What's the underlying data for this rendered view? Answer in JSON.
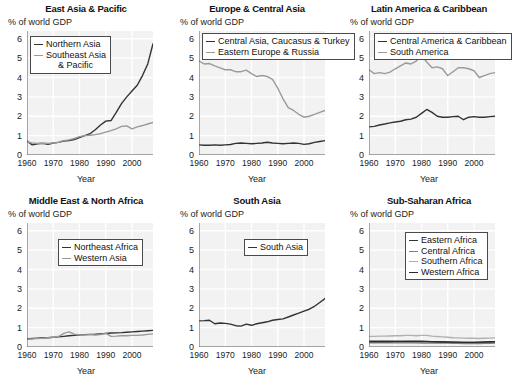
{
  "figure": {
    "ylabel_note": "% of world GDP",
    "xlabel": "Year",
    "yticks": [
      "0",
      "1",
      "2",
      "3",
      "4",
      "5",
      "6"
    ],
    "xticks": [
      "1960",
      "1970",
      "1980",
      "1990",
      "2000"
    ],
    "colors": {
      "dark": "#333333",
      "mid": "#8a8a8a",
      "light": "#b4b4b4",
      "plot_bg": "#f2f2f2",
      "gridline": "#ffffff",
      "legend_border": "#4a4a4a"
    }
  },
  "chart_data": [
    {
      "type": "line",
      "title": "East Asia & Pacific",
      "xlabel": "Year",
      "ylabel": "% of world GDP",
      "xlim": [
        1960,
        2008
      ],
      "ylim": [
        0,
        6.4
      ],
      "grid": true,
      "legend_position": "top-left",
      "x": [
        1960,
        1962,
        1964,
        1966,
        1968,
        1970,
        1972,
        1974,
        1976,
        1978,
        1980,
        1982,
        1984,
        1986,
        1988,
        1990,
        1992,
        1994,
        1996,
        1998,
        2000,
        2002,
        2004,
        2006,
        2008
      ],
      "series": [
        {
          "name": "Northern Asia",
          "color": "#333333",
          "values": [
            0.72,
            0.52,
            0.58,
            0.6,
            0.55,
            0.62,
            0.65,
            0.72,
            0.75,
            0.8,
            0.9,
            1.0,
            1.1,
            1.3,
            1.55,
            1.75,
            1.78,
            2.2,
            2.65,
            3.0,
            3.3,
            3.6,
            4.1,
            4.7,
            5.75
          ]
        },
        {
          "name": "Southeast Asia & Pacific",
          "color": "#9a9a9a",
          "values": [
            0.68,
            0.62,
            0.6,
            0.62,
            0.6,
            0.62,
            0.66,
            0.74,
            0.78,
            0.85,
            0.95,
            1.0,
            1.02,
            1.05,
            1.1,
            1.18,
            1.26,
            1.35,
            1.48,
            1.5,
            1.35,
            1.45,
            1.52,
            1.6,
            1.68
          ]
        }
      ]
    },
    {
      "type": "line",
      "title": "Europe & Central Asia",
      "xlabel": "Year",
      "ylabel": "% of world GDP",
      "xlim": [
        1960,
        2008
      ],
      "ylim": [
        0,
        6.4
      ],
      "grid": true,
      "legend_position": "top-left",
      "x": [
        1960,
        1962,
        1964,
        1966,
        1968,
        1970,
        1972,
        1974,
        1976,
        1978,
        1980,
        1982,
        1984,
        1986,
        1988,
        1990,
        1992,
        1994,
        1996,
        1998,
        2000,
        2002,
        2004,
        2006,
        2008
      ],
      "series": [
        {
          "name": "Central Asia, Caucasus & Turkey",
          "color": "#333333",
          "values": [
            0.52,
            0.5,
            0.5,
            0.52,
            0.5,
            0.52,
            0.54,
            0.6,
            0.62,
            0.6,
            0.58,
            0.6,
            0.62,
            0.66,
            0.62,
            0.6,
            0.58,
            0.6,
            0.62,
            0.6,
            0.55,
            0.58,
            0.65,
            0.7,
            0.74
          ]
        },
        {
          "name": "Eastern Europe & Russia",
          "color": "#9a9a9a",
          "values": [
            4.85,
            4.7,
            4.72,
            4.6,
            4.5,
            4.4,
            4.4,
            4.3,
            4.3,
            4.38,
            4.2,
            4.05,
            4.1,
            4.05,
            3.9,
            3.45,
            2.9,
            2.45,
            2.3,
            2.1,
            1.95,
            2.0,
            2.1,
            2.2,
            2.3
          ]
        }
      ]
    },
    {
      "type": "line",
      "title": "Latin America & Caribbean",
      "xlabel": "Year",
      "ylabel": "% of world GDP",
      "xlim": [
        1960,
        2008
      ],
      "ylim": [
        0,
        6.4
      ],
      "grid": true,
      "legend_position": "top-left",
      "x": [
        1960,
        1962,
        1964,
        1966,
        1968,
        1970,
        1972,
        1974,
        1976,
        1978,
        1980,
        1982,
        1984,
        1986,
        1988,
        1990,
        1992,
        1994,
        1996,
        1998,
        2000,
        2002,
        2004,
        2006,
        2008
      ],
      "series": [
        {
          "name": "Central America & Caribbean",
          "color": "#333333",
          "values": [
            1.45,
            1.48,
            1.55,
            1.6,
            1.66,
            1.7,
            1.74,
            1.82,
            1.85,
            1.95,
            2.15,
            2.35,
            2.2,
            2.0,
            1.95,
            1.95,
            1.98,
            2.0,
            1.82,
            1.95,
            1.98,
            1.95,
            1.95,
            1.98,
            2.0
          ]
        },
        {
          "name": "South America",
          "color": "#9a9a9a",
          "values": [
            4.4,
            4.2,
            4.25,
            4.2,
            4.28,
            4.45,
            4.6,
            4.75,
            4.7,
            4.85,
            5.15,
            4.8,
            4.5,
            4.55,
            4.45,
            4.1,
            4.3,
            4.5,
            4.5,
            4.45,
            4.35,
            4.0,
            4.1,
            4.2,
            4.25
          ]
        }
      ]
    },
    {
      "type": "line",
      "title": "Middle East & North Africa",
      "xlabel": "Year",
      "ylabel": "% of world GDP",
      "xlim": [
        1960,
        2008
      ],
      "ylim": [
        0,
        6.4
      ],
      "grid": true,
      "legend_position": "top-center",
      "x": [
        1960,
        1962,
        1964,
        1966,
        1968,
        1970,
        1972,
        1974,
        1976,
        1978,
        1980,
        1982,
        1984,
        1986,
        1988,
        1990,
        1992,
        1994,
        1996,
        1998,
        2000,
        2002,
        2004,
        2006,
        2008
      ],
      "series": [
        {
          "name": "Northeast Africa",
          "color": "#333333",
          "values": [
            0.42,
            0.44,
            0.46,
            0.48,
            0.48,
            0.5,
            0.52,
            0.55,
            0.58,
            0.6,
            0.62,
            0.64,
            0.65,
            0.66,
            0.68,
            0.7,
            0.72,
            0.73,
            0.74,
            0.76,
            0.78,
            0.8,
            0.82,
            0.84,
            0.86
          ]
        },
        {
          "name": "Western Asia",
          "color": "#9a9a9a",
          "values": [
            0.4,
            0.42,
            0.44,
            0.46,
            0.48,
            0.5,
            0.54,
            0.7,
            0.78,
            0.66,
            0.62,
            0.62,
            0.64,
            0.62,
            0.64,
            0.72,
            0.55,
            0.56,
            0.58,
            0.58,
            0.6,
            0.6,
            0.62,
            0.65,
            0.68
          ]
        }
      ]
    },
    {
      "type": "line",
      "title": "South Asia",
      "xlabel": "Year",
      "ylabel": "% of world GDP",
      "xlim": [
        1960,
        2008
      ],
      "ylim": [
        0,
        6.4
      ],
      "grid": true,
      "legend_position": "top-center",
      "x": [
        1960,
        1962,
        1964,
        1966,
        1968,
        1970,
        1972,
        1974,
        1976,
        1978,
        1980,
        1982,
        1984,
        1986,
        1988,
        1990,
        1992,
        1994,
        1996,
        1998,
        2000,
        2002,
        2004,
        2006,
        2008
      ],
      "series": [
        {
          "name": "South Asia",
          "color": "#333333",
          "values": [
            1.35,
            1.36,
            1.38,
            1.2,
            1.24,
            1.22,
            1.18,
            1.1,
            1.08,
            1.18,
            1.12,
            1.2,
            1.25,
            1.3,
            1.38,
            1.42,
            1.45,
            1.55,
            1.65,
            1.75,
            1.85,
            1.95,
            2.1,
            2.3,
            2.5
          ]
        }
      ]
    },
    {
      "type": "line",
      "title": "Sub-Saharan Africa",
      "xlabel": "Year",
      "ylabel": "% of world GDP",
      "xlim": [
        1960,
        2008
      ],
      "ylim": [
        0,
        6.4
      ],
      "grid": true,
      "legend_position": "top-center",
      "x": [
        1960,
        1962,
        1964,
        1966,
        1968,
        1970,
        1972,
        1974,
        1976,
        1978,
        1980,
        1982,
        1984,
        1986,
        1988,
        1990,
        1992,
        1994,
        1996,
        1998,
        2000,
        2002,
        2004,
        2006,
        2008
      ],
      "series": [
        {
          "name": "Eastern Africa",
          "color": "#333333",
          "values": [
            0.3,
            0.3,
            0.3,
            0.3,
            0.3,
            0.29,
            0.29,
            0.28,
            0.28,
            0.28,
            0.27,
            0.27,
            0.26,
            0.26,
            0.26,
            0.25,
            0.25,
            0.24,
            0.24,
            0.24,
            0.24,
            0.24,
            0.25,
            0.25,
            0.26
          ]
        },
        {
          "name": "Central Africa",
          "color": "#7d7d7d",
          "values": [
            0.22,
            0.22,
            0.22,
            0.22,
            0.22,
            0.22,
            0.22,
            0.22,
            0.22,
            0.22,
            0.21,
            0.21,
            0.21,
            0.2,
            0.2,
            0.2,
            0.19,
            0.19,
            0.18,
            0.18,
            0.18,
            0.18,
            0.19,
            0.19,
            0.2
          ]
        },
        {
          "name": "Southern Africa",
          "color": "#b0b0b0",
          "values": [
            0.55,
            0.55,
            0.56,
            0.56,
            0.57,
            0.58,
            0.58,
            0.6,
            0.6,
            0.58,
            0.6,
            0.6,
            0.56,
            0.54,
            0.52,
            0.5,
            0.48,
            0.47,
            0.46,
            0.45,
            0.45,
            0.44,
            0.45,
            0.46,
            0.47
          ]
        },
        {
          "name": "Western Africa",
          "color": "#2b2b2b",
          "values": [
            0.28,
            0.28,
            0.28,
            0.28,
            0.28,
            0.29,
            0.29,
            0.3,
            0.3,
            0.3,
            0.3,
            0.29,
            0.28,
            0.27,
            0.26,
            0.26,
            0.25,
            0.25,
            0.24,
            0.24,
            0.24,
            0.25,
            0.26,
            0.27,
            0.28
          ]
        }
      ]
    }
  ]
}
